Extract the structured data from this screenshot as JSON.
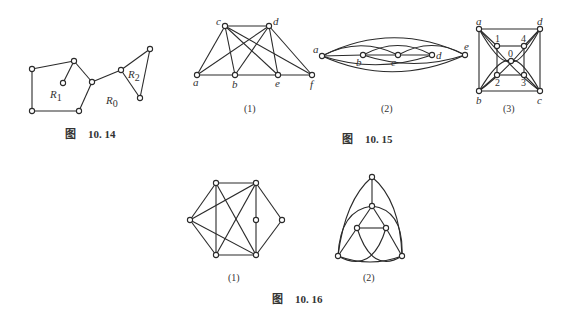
{
  "figures": {
    "fig_10_14": {
      "caption_prefix": "图",
      "caption_number": "10. 14",
      "regions": [
        "R1",
        "R2",
        "R0"
      ],
      "region_labels": {
        "r1": "R",
        "r1_sub": "1",
        "r2": "R",
        "r2_sub": "2",
        "r0": "R",
        "r0_sub": "0"
      }
    },
    "fig_10_15": {
      "caption_prefix": "图",
      "caption_number": "10. 15",
      "sub1": {
        "label": "(1)",
        "vertices": [
          "a",
          "b",
          "c",
          "d",
          "e",
          "f"
        ]
      },
      "sub2": {
        "label": "(2)",
        "vertices": [
          "a",
          "b",
          "c",
          "d",
          "e"
        ]
      },
      "sub3": {
        "label": "(3)",
        "vertices": [
          "a",
          "b",
          "c",
          "d",
          "0",
          "1",
          "2",
          "3",
          "4"
        ]
      }
    },
    "fig_10_16": {
      "caption_prefix": "图",
      "caption_number": "10. 16",
      "sub1": {
        "label": "(1)"
      },
      "sub2": {
        "label": "(2)"
      }
    }
  },
  "colors": {
    "ink": "#2a2a2a",
    "background": "#ffffff"
  }
}
